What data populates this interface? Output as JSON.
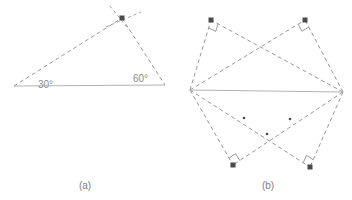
{
  "figure": {
    "background_color": "#ffffff",
    "solid_line_color": "#b3b3b3",
    "dashed_line_color": "#9a9a9a",
    "marker_color": "#4a4a4a",
    "text_color": "#8c8c8c",
    "caption_color": "#7d7d7d"
  },
  "panel_a": {
    "caption": "(a)",
    "caption_pos": {
      "x": 85,
      "y": 189
    },
    "angle_labels": [
      {
        "text": "30°",
        "x": 38,
        "y": 88
      },
      {
        "text": "60°",
        "x": 133,
        "y": 82
      }
    ],
    "base_line": {
      "x1": 14,
      "y1": 86,
      "x2": 165,
      "y2": 85
    },
    "dashed_sides": [
      {
        "x1": 14,
        "y1": 86,
        "x2": 122,
        "y2": 18
      },
      {
        "x1": 122,
        "y1": 18,
        "x2": 165,
        "y2": 85
      }
    ],
    "dashed_crossing": [
      {
        "x1": 110,
        "y1": 6,
        "x2": 130,
        "y2": 31
      },
      {
        "x1": 106,
        "y1": 27,
        "x2": 141,
        "y2": 12
      }
    ],
    "apex_marker": {
      "x": 122,
      "y": 18,
      "size": 5
    }
  },
  "panel_b": {
    "caption": "(b)",
    "caption_pos": {
      "x": 268,
      "y": 189
    },
    "base_line": {
      "x1": 190,
      "y1": 90,
      "x2": 343,
      "y2": 92
    },
    "vertices": [
      {
        "name": "top-left",
        "x": 211,
        "y": 20
      },
      {
        "name": "top-right",
        "x": 305,
        "y": 20
      },
      {
        "name": "bottom-left",
        "x": 233,
        "y": 165
      },
      {
        "name": "bottom-right",
        "x": 310,
        "y": 167
      }
    ],
    "endpoints": [
      {
        "name": "left-endpoint",
        "x": 190,
        "y": 90
      },
      {
        "name": "right-endpoint",
        "x": 343,
        "y": 92
      }
    ],
    "right_angle_marks": [
      {
        "vertex": "top-left",
        "x": 211,
        "y": 20
      },
      {
        "vertex": "top-right",
        "x": 305,
        "y": 20
      },
      {
        "vertex": "bottom-left",
        "x": 233,
        "y": 165
      },
      {
        "vertex": "bottom-right",
        "x": 310,
        "y": 167
      }
    ],
    "midpoint_dots": [
      {
        "x": 244,
        "y": 118
      },
      {
        "x": 290,
        "y": 119
      },
      {
        "x": 267,
        "y": 134
      }
    ],
    "marker_size": 5
  }
}
